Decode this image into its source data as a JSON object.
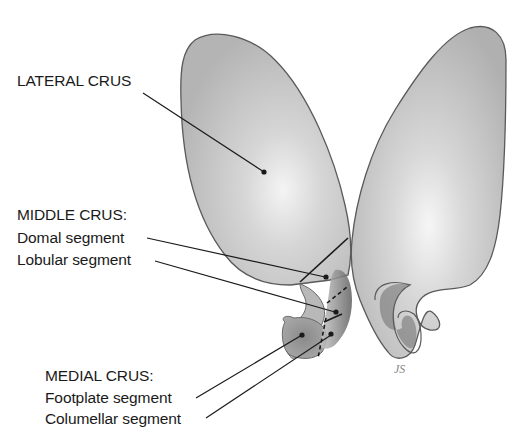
{
  "diagram": {
    "labels": {
      "lateral_crus": "LATERAL CRUS",
      "middle_crus_heading": "MIDDLE CRUS:",
      "domal_segment": "Domal segment",
      "lobular_segment": "Lobular segment",
      "medial_crus_heading": "MEDIAL CRUS:",
      "footplate_segment": "Footplate segment",
      "columellar_segment": "Columellar segment"
    },
    "signature": "JS",
    "colors": {
      "background": "#ffffff",
      "cartilage_fill": "#c9c9c9",
      "cartilage_highlight": "#eeeeee",
      "cartilage_shadow": "#7a7a7a",
      "outline": "#555555",
      "leader_line": "#1a1a1a",
      "text": "#1a1a1a"
    }
  }
}
